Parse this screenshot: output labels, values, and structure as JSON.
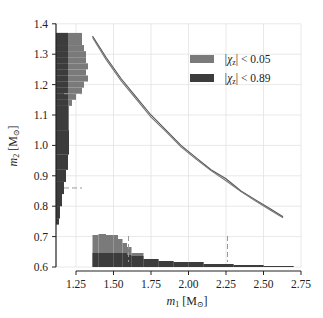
{
  "chart_data": {
    "type": "line",
    "title": "",
    "xlabel": "m1 [M☉]",
    "ylabel": "m2 [M☉]",
    "xlabel_parts": {
      "var": "m",
      "sub": "1",
      "unit": " [M",
      "unit_sub": "⊙",
      "close": "]"
    },
    "ylabel_parts": {
      "var": "m",
      "sub": "2",
      "unit": " [M",
      "unit_sub": "⊙",
      "close": "]"
    },
    "xlim": [
      1.1,
      2.8
    ],
    "ylim": [
      0.6,
      1.4
    ],
    "x_ticks": [
      "1.25",
      "1.50",
      "1.75",
      "2.00",
      "2.25",
      "2.50",
      "2.75"
    ],
    "x_tick_values": [
      1.25,
      1.5,
      1.75,
      2.0,
      2.25,
      2.5,
      2.75
    ],
    "y_ticks": [
      "1.4",
      "1.3",
      "1.2",
      "1.1",
      "1.0",
      "0.9",
      "0.8",
      "0.7",
      "0.6"
    ],
    "y_tick_values": [
      1.4,
      1.3,
      1.2,
      1.1,
      1.0,
      0.9,
      0.8,
      0.7,
      0.6
    ],
    "grid": true,
    "legend_position": "upper right",
    "legend": [
      {
        "label_prefix": "|χ",
        "label_sub": "z",
        "label_suffix": "| < 0.05",
        "color": "#7a7a7a"
      },
      {
        "label_prefix": "|χ",
        "label_sub": "z",
        "label_suffix": "| < 0.89",
        "color": "#3c3c3c"
      }
    ],
    "series": [
      {
        "name": "|χz| < 0.05 curve",
        "color": "#555555",
        "x": [
          1.36,
          1.45,
          1.55,
          1.65,
          1.75,
          1.85,
          1.95,
          2.05,
          2.15,
          2.25,
          2.35,
          2.45,
          2.55,
          2.63
        ],
        "y": [
          1.36,
          1.29,
          1.22,
          1.16,
          1.1,
          1.05,
          1.0,
          0.96,
          0.92,
          0.89,
          0.85,
          0.82,
          0.79,
          0.765
        ]
      },
      {
        "name": "|χz| < 0.89 curve",
        "color": "#777777",
        "x": [
          1.36,
          1.45,
          1.55,
          1.65,
          1.75,
          1.85,
          1.95,
          2.05,
          2.15,
          2.25,
          2.35,
          2.45,
          2.55,
          2.63
        ],
        "y": [
          1.355,
          1.283,
          1.213,
          1.153,
          1.093,
          1.045,
          0.995,
          0.955,
          0.917,
          0.884,
          0.848,
          0.816,
          0.786,
          0.762
        ]
      }
    ],
    "marginal_m2": {
      "bins": [
        1.37,
        1.35,
        1.33,
        1.31,
        1.29,
        1.27,
        1.25,
        1.23,
        1.21,
        1.19,
        1.17,
        1.15,
        1.13,
        1.05,
        0.97,
        0.92,
        0.88,
        0.84,
        0.8,
        0.76,
        0.74
      ],
      "light_width_px": [
        26,
        26,
        28,
        30,
        30,
        32,
        30,
        32,
        28,
        26,
        20,
        16,
        13,
        13,
        12,
        10,
        8,
        6,
        4,
        3,
        2
      ],
      "dark_width_px": [
        12,
        12,
        12,
        12,
        12,
        12,
        12,
        12,
        12,
        12,
        12,
        12,
        12,
        13,
        12,
        10,
        8,
        6,
        4,
        3,
        2
      ],
      "dashed_markers_m2": [
        1.17,
        0.86
      ]
    },
    "marginal_m1": {
      "bins": [
        1.36,
        1.4,
        1.45,
        1.5,
        1.53,
        1.56,
        1.59,
        1.62,
        1.7,
        1.8,
        1.9,
        2.0,
        2.1,
        2.3,
        2.5,
        2.7
      ],
      "light_height_px": [
        32,
        33,
        32,
        32,
        28,
        24,
        20,
        14,
        8,
        6,
        5,
        5,
        3,
        2,
        1,
        1
      ],
      "dark_height_px": [
        14,
        14,
        14,
        14,
        14,
        14,
        12,
        11,
        8,
        6,
        5,
        5,
        3,
        2,
        1,
        1
      ],
      "dashed_markers_m1": [
        1.6,
        2.26
      ]
    }
  }
}
